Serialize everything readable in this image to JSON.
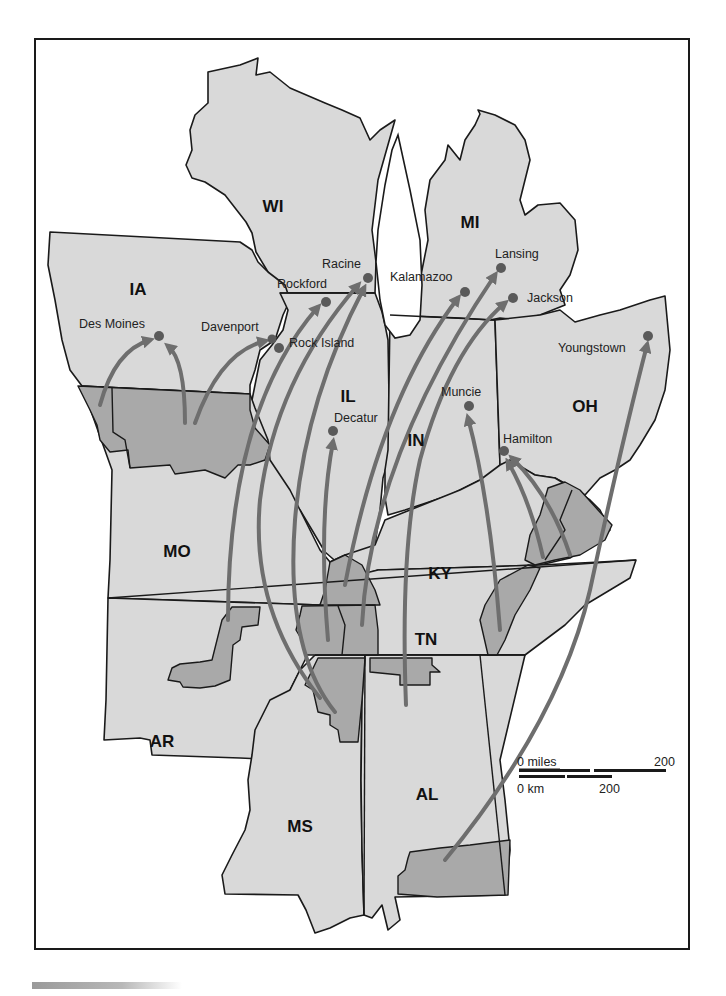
{
  "map": {
    "title": "",
    "states": [
      {
        "abbr": "WI",
        "x": 273,
        "y": 212
      },
      {
        "abbr": "MI",
        "x": 470,
        "y": 228
      },
      {
        "abbr": "IA",
        "x": 138,
        "y": 295
      },
      {
        "abbr": "IL",
        "x": 348,
        "y": 402
      },
      {
        "abbr": "OH",
        "x": 585,
        "y": 412
      },
      {
        "abbr": "IN",
        "x": 416,
        "y": 446
      },
      {
        "abbr": "MO",
        "x": 177,
        "y": 557
      },
      {
        "abbr": "KY",
        "x": 440,
        "y": 579
      },
      {
        "abbr": "TN",
        "x": 426,
        "y": 645
      },
      {
        "abbr": "AR",
        "x": 162,
        "y": 747
      },
      {
        "abbr": "AL",
        "x": 427,
        "y": 800
      },
      {
        "abbr": "MS",
        "x": 300,
        "y": 832
      }
    ],
    "cities": [
      {
        "name": "Racine",
        "dot_x": 368,
        "dot_y": 278,
        "label_x": 322,
        "label_y": 268
      },
      {
        "name": "Rockford",
        "dot_x": 326,
        "dot_y": 302,
        "label_x": 277,
        "label_y": 288
      },
      {
        "name": "Kalamazoo",
        "dot_x": 465,
        "dot_y": 292,
        "label_x": 390,
        "label_y": 281
      },
      {
        "name": "Lansing",
        "dot_x": 501,
        "dot_y": 268,
        "label_x": 495,
        "label_y": 258
      },
      {
        "name": "Jackson",
        "dot_x": 513,
        "dot_y": 298,
        "label_x": 527,
        "label_y": 302
      },
      {
        "name": "Des Moines",
        "dot_x": 159,
        "dot_y": 336,
        "label_x": 79,
        "label_y": 328
      },
      {
        "name": "Davenport",
        "dot_x": 272,
        "dot_y": 339,
        "label_x": 201,
        "label_y": 331
      },
      {
        "name": "Rock Island",
        "dot_x": 279,
        "dot_y": 348,
        "label_x": 289,
        "label_y": 347
      },
      {
        "name": "Youngstown",
        "dot_x": 648,
        "dot_y": 336,
        "label_x": 558,
        "label_y": 352
      },
      {
        "name": "Muncie",
        "dot_x": 469,
        "dot_y": 406,
        "label_x": 441,
        "label_y": 396
      },
      {
        "name": "Decatur",
        "dot_x": 333,
        "dot_y": 431,
        "label_x": 334,
        "label_y": 422
      },
      {
        "name": "Hamilton",
        "dot_x": 504,
        "dot_y": 451,
        "label_x": 503,
        "label_y": 443
      }
    ],
    "scale_bar": {
      "miles_label": "0 miles",
      "miles_max": "200",
      "km_label": "0 km",
      "km_max": "200"
    },
    "colors": {
      "state_fill": "#d9d9d9",
      "origin_region_fill": "#a9a9a9",
      "arrow": "#6e6e6e",
      "outline": "#1a1a1a"
    }
  }
}
